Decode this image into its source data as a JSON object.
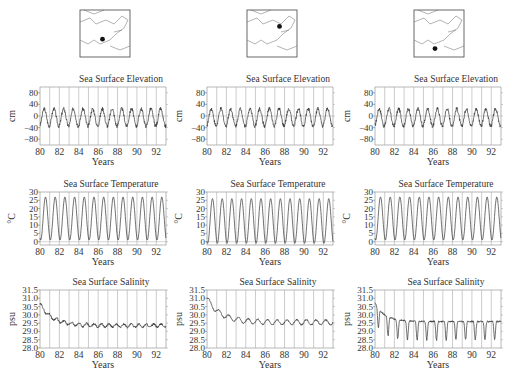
{
  "chart_data": [
    {
      "column": 0,
      "map": {
        "dot": [
          0.45,
          0.62
        ]
      },
      "panels": [
        {
          "type": "line",
          "title": "Sea Surface Elevation",
          "xlabel": "Years",
          "ylabel": "cm",
          "ylim": [
            -100,
            100
          ],
          "yticks": [
            80,
            40,
            0,
            -40,
            -80
          ],
          "xticks": [
            80,
            82,
            84,
            86,
            88,
            90,
            92
          ],
          "xlim": [
            80,
            93
          ],
          "series_desc": "annual cycle ~ -40 to +30"
        },
        {
          "type": "line",
          "title": "Sea Surface Temperature",
          "xlabel": "Years",
          "ylabel": "°C",
          "ylim": [
            -2,
            30
          ],
          "yticks": [
            30,
            25,
            20,
            15,
            10,
            5,
            0
          ],
          "xticks": [
            80,
            82,
            84,
            86,
            88,
            90,
            92
          ],
          "xlim": [
            80,
            93
          ],
          "series_desc": "annual cycle ~ 1 to 27"
        },
        {
          "type": "line",
          "title": "Sea Surface Salinity",
          "xlabel": "Years",
          "ylabel": "psu",
          "ylim": [
            28,
            31.5
          ],
          "yticks": [
            31.5,
            31.0,
            30.5,
            30.0,
            29.5,
            29.0,
            28.5,
            28.0
          ],
          "xticks": [
            80,
            82,
            84,
            86,
            88,
            90,
            92
          ],
          "xlim": [
            80,
            93
          ],
          "series_desc": "declines from 30.6 to ~29.3"
        }
      ]
    },
    {
      "column": 1,
      "map": {
        "dot": [
          0.65,
          0.35
        ]
      },
      "panels": [
        {
          "type": "line",
          "title": "Sea Surface Elevation",
          "xlabel": "Years",
          "ylabel": "cm",
          "ylim": [
            -100,
            100
          ],
          "yticks": [
            80,
            40,
            0,
            -40,
            -80
          ],
          "xticks": [
            80,
            82,
            84,
            86,
            88,
            90,
            92
          ],
          "xlim": [
            80,
            93
          ]
        },
        {
          "type": "line",
          "title": "Sea Surface Temperature",
          "xlabel": "Years",
          "ylabel": "°C",
          "ylim": [
            -2,
            30
          ],
          "yticks": [
            30,
            25,
            20,
            15,
            10,
            5,
            0
          ],
          "xticks": [
            80,
            82,
            84,
            86,
            88,
            90,
            92
          ],
          "xlim": [
            80,
            93
          ]
        },
        {
          "type": "line",
          "title": "Sea Surface Salinity",
          "xlabel": "Years",
          "ylabel": "psu",
          "ylim": [
            28,
            31.5
          ],
          "yticks": [
            31.5,
            31.0,
            30.5,
            30.0,
            29.5,
            29.0,
            28.5,
            28.0
          ],
          "xticks": [
            80,
            82,
            84,
            86,
            88,
            90,
            92
          ],
          "xlim": [
            80,
            93
          ],
          "series_desc": "declines from 31.0 to ~29.5"
        }
      ]
    },
    {
      "column": 2,
      "map": {
        "dot": [
          0.42,
          0.82
        ]
      },
      "panels": [
        {
          "type": "line",
          "title": "Sea Surface Elevation",
          "xlabel": "Years",
          "ylabel": "cm",
          "ylim": [
            -100,
            100
          ],
          "yticks": [
            80,
            40,
            0,
            -40,
            -80
          ],
          "xticks": [
            80,
            82,
            84,
            86,
            88,
            90,
            92
          ],
          "xlim": [
            80,
            93
          ]
        },
        {
          "type": "line",
          "title": "Sea Surface Temperature",
          "xlabel": "Years",
          "ylabel": "°C",
          "ylim": [
            -2,
            30
          ],
          "yticks": [
            30,
            25,
            20,
            15,
            10,
            5,
            0
          ],
          "xticks": [
            80,
            82,
            84,
            86,
            88,
            90,
            92
          ],
          "xlim": [
            80,
            93
          ]
        },
        {
          "type": "line",
          "title": "Sea Surface Salinity",
          "xlabel": "Years",
          "ylabel": "psu",
          "ylim": [
            28,
            31.5
          ],
          "yticks": [
            31.5,
            31.0,
            30.5,
            30.0,
            29.5,
            29.0,
            28.5,
            28.0
          ],
          "xticks": [
            80,
            82,
            84,
            86,
            88,
            90,
            92
          ],
          "xlim": [
            80,
            93
          ],
          "series_desc": "strong seasonal dips 28.2 to 29.8"
        }
      ]
    }
  ]
}
